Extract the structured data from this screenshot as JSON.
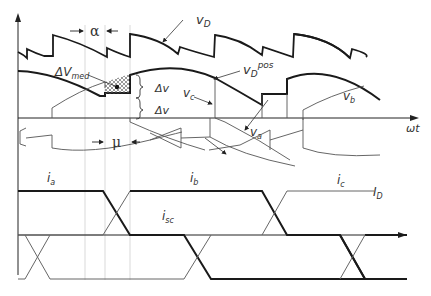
{
  "diagram": {
    "type": "waveform-timing-diagram",
    "labels": {
      "vD": "v",
      "vD_sub": "D",
      "vDpos": "v",
      "vDpos_sub": "D",
      "vDpos_sup": "pos",
      "dVmed": "ΔV",
      "dVmed_sub": "med",
      "dv1": "Δv",
      "dv2": "Δv",
      "vc": "v",
      "vc_sub": "c",
      "vb": "v",
      "vb_sub": "b",
      "va": "v",
      "va_sub": "a",
      "wt": "ωt",
      "alpha": "α",
      "mu": "μ",
      "ia": "i",
      "ia_sub": "a",
      "ib": "i",
      "ib_sub": "b",
      "ic": "i",
      "ic_sub": "c",
      "ID": "I",
      "ID_sub": "D",
      "isc": "i",
      "isc_sub": "sc"
    },
    "colors": {
      "bold_line": "#1a1a1a",
      "thin_line": "#555555",
      "guide_line": "#cccccc",
      "hatch": "#555555"
    }
  }
}
